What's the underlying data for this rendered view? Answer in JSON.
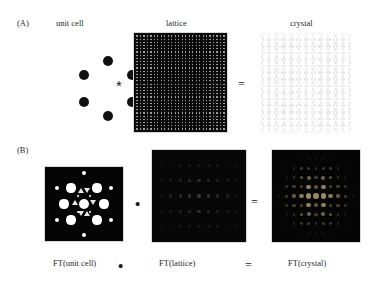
{
  "figure": {
    "caption_rows": [
      "A",
      "B"
    ],
    "background": "#ffffff",
    "ink": "#2b2b2b"
  },
  "rows": {
    "a": {
      "tag": "(A)",
      "titles": {
        "unit_cell": "unit cell",
        "lattice": "lattice",
        "crystal": "crystal"
      },
      "operators": {
        "convolution": "*",
        "equals": "="
      },
      "unit_cell": {
        "description": "six-dot hexagonal ring motif",
        "dot_color": "#111111",
        "dot_count": 6,
        "dots": [
          {
            "cx": 50,
            "cy": 14,
            "r": 5.0
          },
          {
            "cx": 74,
            "cy": 28,
            "r": 5.0
          },
          {
            "cx": 74,
            "cy": 55,
            "r": 5.0
          },
          {
            "cx": 50,
            "cy": 69,
            "r": 5.0
          },
          {
            "cx": 26,
            "cy": 55,
            "r": 5.0
          },
          {
            "cx": 26,
            "cy": 28,
            "r": 5.0
          }
        ]
      },
      "lattice": {
        "description": "dense periodic grid of bright points on black",
        "background": "#0a0a0a",
        "point_color": "#c9c9c9",
        "columns": 26,
        "rows_count": 30,
        "spacing_x": 3.4,
        "spacing_y": 3.1
      },
      "crystal": {
        "description": "unit cell convolved with lattice, rendered very faint",
        "background": "#ffffff",
        "point_color": "#e8e8e8",
        "columns": 13,
        "rows_count": 15
      }
    },
    "b": {
      "tag": "(B)",
      "labels": {
        "ft_unit_cell": "FT(unit cell)",
        "ft_lattice": "FT(lattice)",
        "ft_crystal": "FT(crystal)"
      },
      "operators": {
        "multiply": "•",
        "equals": "="
      },
      "ft_unit_cell": {
        "description": "hexagonal diffraction pattern, bright spots of graded size on black",
        "background": "#050505",
        "spot_color": "#ffffff",
        "spots": [
          {
            "cx": 39,
            "cy": 6,
            "r": 2.0
          },
          {
            "cx": 39,
            "cy": 68,
            "r": 2.0
          },
          {
            "cx": 12,
            "cy": 21,
            "r": 2.4
          },
          {
            "cx": 66,
            "cy": 21,
            "r": 2.4
          },
          {
            "cx": 12,
            "cy": 53,
            "r": 2.4
          },
          {
            "cx": 66,
            "cy": 53,
            "r": 2.4
          },
          {
            "cx": 26,
            "cy": 21,
            "r": 4.6
          },
          {
            "cx": 52,
            "cy": 21,
            "r": 4.6
          },
          {
            "cx": 26,
            "cy": 53,
            "r": 4.6
          },
          {
            "cx": 52,
            "cy": 53,
            "r": 4.6
          },
          {
            "cx": 19,
            "cy": 37,
            "r": 4.6
          },
          {
            "cx": 59,
            "cy": 37,
            "r": 4.6
          },
          {
            "cx": 39,
            "cy": 37,
            "r": 5.2
          },
          {
            "cx": 33,
            "cy": 29,
            "r": 1.4
          },
          {
            "cx": 45,
            "cy": 29,
            "r": 1.4
          },
          {
            "cx": 33,
            "cy": 45,
            "r": 1.4
          },
          {
            "cx": 45,
            "cy": 45,
            "r": 1.4
          }
        ]
      },
      "ft_lattice": {
        "description": "sparse reciprocal lattice of dim points on black",
        "background": "#070707",
        "point_color": "#3a3a3a",
        "columns": 9,
        "rows_count": 5
      },
      "ft_crystal": {
        "description": "product of the two transforms: hexagonally modulated reciprocal lattice",
        "background": "#050505",
        "point_color": "#9a8a5a",
        "columns": 11,
        "rows_count": 9
      }
    }
  }
}
